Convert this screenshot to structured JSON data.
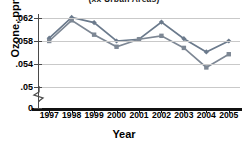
{
  "chart_data": {
    "type": "line",
    "title": "(xx Urban Areas)",
    "xlabel": "Year",
    "ylabel": "Ozone, ppm",
    "categories": [
      "1997",
      "1998",
      "1999",
      "2000",
      "2001",
      "2002",
      "2003",
      "2004",
      "2005"
    ],
    "x": [
      1997,
      1998,
      1999,
      2000,
      2001,
      2002,
      2003,
      2004,
      2005
    ],
    "series": [
      {
        "name": "series-1",
        "color": "#6b7a8c",
        "marker": "diamond",
        "values": [
          0.0585,
          0.0621,
          0.0612,
          0.058,
          0.0583,
          0.0613,
          0.0584,
          0.0561,
          0.058
        ]
      },
      {
        "name": "series-2",
        "color": "#7d8794",
        "marker": "square",
        "values": [
          0.058,
          0.0616,
          0.0591,
          0.057,
          0.0583,
          0.0589,
          0.0568,
          0.0534,
          0.0557
        ]
      }
    ],
    "ylim": [
      0.048,
      0.0635
    ],
    "yticks": [
      0.062,
      0.058,
      0.054,
      0.05,
      0
    ],
    "ytick_labels": [
      ".062",
      ".058",
      ".054",
      ".05",
      "0"
    ],
    "grid": true,
    "grid_axis": "y",
    "axis_break": true,
    "legend": "none"
  }
}
